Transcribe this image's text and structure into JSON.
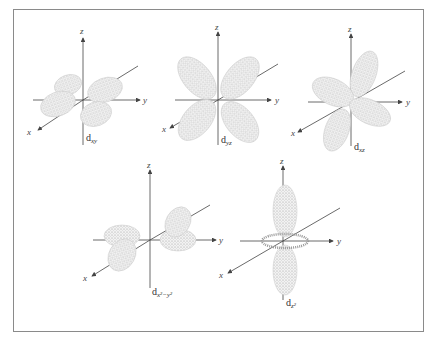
{
  "figure": {
    "orbitals": [
      {
        "id": "dxy",
        "caption_main": "d",
        "caption_sub": "xy",
        "axes": {
          "x": "x",
          "y": "y",
          "z": "z"
        }
      },
      {
        "id": "dyz",
        "caption_main": "d",
        "caption_sub": "yz",
        "axes": {
          "x": "x",
          "y": "y",
          "z": "z"
        }
      },
      {
        "id": "dxz",
        "caption_main": "d",
        "caption_sub": "xz",
        "axes": {
          "x": "x",
          "y": "y",
          "z": "z"
        }
      },
      {
        "id": "dx2y2",
        "caption_main": "d",
        "caption_sub": "x²−y²",
        "axes": {
          "x": "x",
          "y": "y",
          "z": "z"
        }
      },
      {
        "id": "dz2",
        "caption_main": "d",
        "caption_sub": "z²",
        "axes": {
          "x": "x",
          "y": "y",
          "z": "z"
        }
      }
    ]
  }
}
